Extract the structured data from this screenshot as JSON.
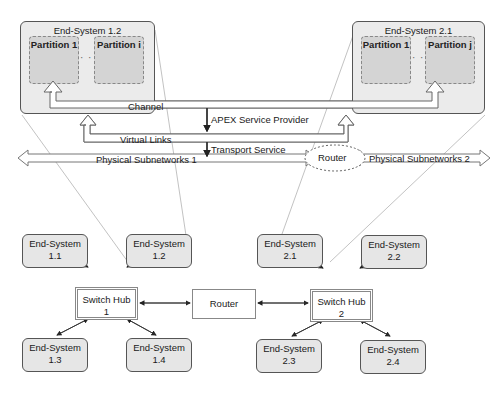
{
  "top": {
    "end_system_left": {
      "title": "End-System 1.2",
      "partitions": [
        "Partition 1",
        "Partition i"
      ],
      "ellipsis": "· · ·"
    },
    "end_system_right": {
      "title": "End-System 2.1",
      "partitions": [
        "Partition 1",
        "Partition j"
      ],
      "ellipsis": "· · ·"
    },
    "layers": {
      "channel": "Channel",
      "apex": "APEX Service Provider",
      "virtual_links": "Virtual Links",
      "transport": "Transport Service",
      "phys1": "Physical Subnetworks 1",
      "phys2": "Physical Subnetworks 2",
      "router": "Router"
    }
  },
  "bottom": {
    "net1": {
      "hub": [
        "Switch Hub",
        "1"
      ],
      "end_systems": [
        [
          "End-System",
          "1.1"
        ],
        [
          "End-System",
          "1.2"
        ],
        [
          "End-System",
          "1.3"
        ],
        [
          "End-System",
          "1.4"
        ]
      ]
    },
    "router": "Router",
    "net2": {
      "hub": [
        "Switch Hub",
        "2"
      ],
      "end_systems": [
        [
          "End-System",
          "2.1"
        ],
        [
          "End-System",
          "2.2"
        ],
        [
          "End-System",
          "2.3"
        ],
        [
          "End-System",
          "2.4"
        ]
      ]
    }
  },
  "colors": {
    "end_system_fill": "#e6e6e6",
    "partition_fill": "#d4d4d4",
    "line": "#555555"
  }
}
